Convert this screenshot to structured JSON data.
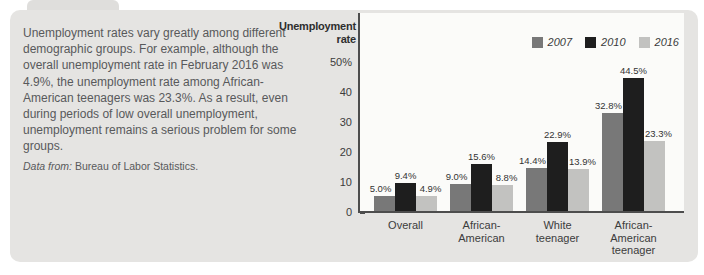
{
  "figure": {
    "narrative": "Unemployment rates vary greatly among different demographic groups. For example, although the overall unemployment rate in February 2016 was 4.9%, the unemployment rate among African-American teenagers was 23.3%. As a result, even during periods of low overall unemployment, unemployment remains a serious problem for some groups.",
    "source_prefix": "Data from:",
    "source": "Bureau of Labor Statistics."
  },
  "chart_data": {
    "type": "bar",
    "axis_title": "Unemployment rate",
    "categories": [
      "Overall",
      "African-American",
      "White teenager",
      "African-American teenager"
    ],
    "category_label_lines": [
      [
        "Overall"
      ],
      [
        "African-",
        "American"
      ],
      [
        "White",
        "teenager"
      ],
      [
        "African-",
        "American",
        "teenager"
      ]
    ],
    "series": [
      {
        "name": "2007",
        "color": "#787878",
        "values": [
          5.0,
          9.0,
          14.4,
          32.8
        ]
      },
      {
        "name": "2010",
        "color": "#1e1e1e",
        "values": [
          9.4,
          15.6,
          22.9,
          44.5
        ]
      },
      {
        "name": "2016",
        "color": "#c2c2c0",
        "values": [
          4.9,
          8.8,
          13.9,
          23.3
        ]
      }
    ],
    "bar_labels": [
      [
        "5.0%",
        "9.0%",
        "14.4%",
        "32.8%"
      ],
      [
        "9.4%",
        "15.6%",
        "22.9%",
        "44.5%"
      ],
      [
        "4.9%",
        "8.8%",
        "13.9%",
        "23.3%"
      ]
    ],
    "y_ticks": [
      {
        "v": 0,
        "label": "0"
      },
      {
        "v": 10,
        "label": "10"
      },
      {
        "v": 20,
        "label": "20"
      },
      {
        "v": 30,
        "label": "30"
      },
      {
        "v": 40,
        "label": "40"
      },
      {
        "v": 50,
        "label": "50%"
      }
    ],
    "ylim": [
      0,
      50
    ],
    "grid": false,
    "legend_position": "top-right"
  },
  "palette": {
    "card_bg": "#e5e4e2",
    "plot_bg": "#fbfbf9",
    "axis": "#4d4d4d",
    "body_text": "#58595b",
    "chart_text": "#3c3c3c"
  }
}
